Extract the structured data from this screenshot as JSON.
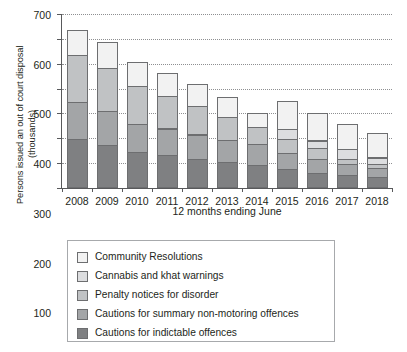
{
  "chart_data": {
    "type": "bar",
    "stacked": true,
    "title": "",
    "xlabel": "12 months ending June",
    "ylabel": "Persons issued an out of court disposal",
    "ylabel_sub": "(thousands)",
    "ylim": [
      0,
      700
    ],
    "yticks": [
      0,
      100,
      200,
      300,
      400,
      500,
      600,
      700
    ],
    "grid": true,
    "legend_position": "below",
    "categories": [
      "2008",
      "2009",
      "2010",
      "2011",
      "2012",
      "2013",
      "2014",
      "2015",
      "2016",
      "2017",
      "2018"
    ],
    "series": [
      {
        "name": "Cautions for indictable offences",
        "color": "#7f8082",
        "values": [
          196,
          173,
          144,
          132,
          117,
          105,
          93,
          75,
          60,
          53,
          45
        ]
      },
      {
        "name": "Cautions for summary non-motoring offences",
        "color": "#a3a5a7",
        "values": [
          153,
          139,
          117,
          110,
          101,
          89,
          86,
          69,
          60,
          45,
          39
        ]
      },
      {
        "name": "Penalty notices for disorder",
        "color": "#c0c2c4",
        "values": [
          192,
          176,
          153,
          133,
          117,
          96,
          71,
          57,
          45,
          23,
          18
        ]
      },
      {
        "name": "Cannabis and khat warnings",
        "color": "#dcdddf",
        "values": [
          0,
          0,
          0,
          0,
          0,
          0,
          0,
          43,
          34,
          44,
          28
        ]
      },
      {
        "name": "Community Resolutions",
        "color": "#f2f2f2",
        "values": [
          105,
          109,
          102,
          96,
          92,
          83,
          59,
          116,
          114,
          104,
          102
        ]
      }
    ],
    "totals": [
      646,
      597,
      516,
      471,
      427,
      373,
      309,
      360,
      313,
      269,
      232
    ]
  },
  "legend": {
    "items": [
      {
        "label": "Community Resolutions",
        "color": "#f2f2f2"
      },
      {
        "label": "Cannabis and khat warnings",
        "color": "#dcdddf"
      },
      {
        "label": "Penalty notices for disorder",
        "color": "#c0c2c4"
      },
      {
        "label": "Cautions for summary non-motoring offences",
        "color": "#a3a5a7"
      },
      {
        "label": "Cautions for indictable offences",
        "color": "#7f8082"
      }
    ]
  }
}
